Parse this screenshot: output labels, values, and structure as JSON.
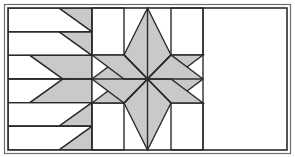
{
  "figure": {
    "kind": "quilt-block-diagram",
    "width": 295,
    "height": 157
  },
  "colors": {
    "background": "#ffffff",
    "patch_light": "#ffffff",
    "patch_gray": "#c9c9c9",
    "line": "#2b2b2b",
    "outer_border": "#6e6e6e"
  },
  "geometry": {
    "canvas": {
      "width": 295,
      "height": 157
    },
    "frame": {
      "x": 8,
      "y": 8,
      "width": 279,
      "height": 142
    },
    "center_block": {
      "x": 92,
      "y": 8,
      "width": 111,
      "height": 142
    },
    "star": {
      "center_x": 147.5,
      "center_y": 79,
      "points": 8,
      "outer_radius_axis": 71,
      "outer_radius_diag": 55,
      "diamond_count": 8
    },
    "side_panel_rows": [
      8,
      31.7,
      55.4,
      79,
      102.6,
      126.3,
      150
    ],
    "left_panel": {
      "x": 8,
      "y": 8,
      "width": 84,
      "height": 142
    },
    "right_panel": {
      "x": 203,
      "y": 8,
      "width": 84,
      "height": 142
    },
    "slant_offset": 33,
    "stroke_width": 1.4,
    "border_stroke_width": 1.6
  },
  "star_diamonds": [
    {
      "name": "diamond-north",
      "fill": "patch_gray"
    },
    {
      "name": "diamond-northeast",
      "fill": "patch_gray"
    },
    {
      "name": "diamond-east",
      "fill": "patch_gray"
    },
    {
      "name": "diamond-southeast",
      "fill": "patch_gray"
    },
    {
      "name": "diamond-south",
      "fill": "patch_gray"
    },
    {
      "name": "diamond-southwest",
      "fill": "patch_gray"
    },
    {
      "name": "diamond-west",
      "fill": "patch_gray"
    },
    {
      "name": "diamond-northwest",
      "fill": "patch_gray"
    }
  ],
  "corner_squares": [
    {
      "name": "corner-square-top-left",
      "fill": "patch_light"
    },
    {
      "name": "corner-square-top-right",
      "fill": "patch_light"
    },
    {
      "name": "corner-square-bottom-left",
      "fill": "patch_light"
    },
    {
      "name": "corner-square-bottom-right",
      "fill": "patch_light"
    }
  ],
  "side_rows": [
    {
      "index": 0,
      "left_fill": "patch_light",
      "right_fill": "patch_gray",
      "slant": "down-right"
    },
    {
      "index": 1,
      "left_fill": "patch_light",
      "right_fill": "patch_gray",
      "slant": "down-right"
    },
    {
      "index": 2,
      "left_fill": "patch_light",
      "right_fill": "patch_gray",
      "slant": "down-right"
    },
    {
      "index": 3,
      "left_fill": "patch_light",
      "right_fill": "patch_gray",
      "slant": "up-right"
    },
    {
      "index": 4,
      "left_fill": "patch_light",
      "right_fill": "patch_gray",
      "slant": "up-right"
    },
    {
      "index": 5,
      "left_fill": "patch_light",
      "right_fill": "patch_gray",
      "slant": "up-right"
    }
  ],
  "labels": {
    "alt_text": "Geometric quilt block: a gray eight-pointed star centered between two mirrored panels of six slanted parallelogram rows forming chevrons."
  }
}
